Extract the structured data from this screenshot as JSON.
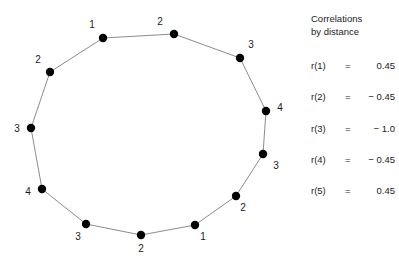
{
  "figure": {
    "background_color": "#ffffff",
    "node_color": "#000000",
    "edge_color": "#8c8c8c",
    "text_color": "#1b1b1b"
  },
  "legend": {
    "title": "Correlations\nby distance",
    "title_line_1": "Correlations",
    "title_line_2": "by distance",
    "rows": [
      {
        "key": "r(1)",
        "eq": "=",
        "value": "0.45"
      },
      {
        "key": "r(2)",
        "eq": "=",
        "value": "− 0.45"
      },
      {
        "key": "r(3)",
        "eq": "=",
        "value": "− 1.0"
      },
      {
        "key": "r(4)",
        "eq": "=",
        "value": "− 0.45"
      },
      {
        "key": "r(5)",
        "eq": "=",
        "value": "0.45"
      }
    ]
  },
  "chart_data": {
    "type": "scatter",
    "title": "Correlations by distance",
    "xlabel": "",
    "ylabel": "",
    "node_count": 12,
    "nodes": [
      {
        "index": 0,
        "label": "2",
        "x": 174,
        "y": 34,
        "label_x": 160,
        "label_y": 22
      },
      {
        "index": 1,
        "label": "3",
        "x": 240,
        "y": 58,
        "label_x": 251,
        "label_y": 45
      },
      {
        "index": 2,
        "label": "4",
        "x": 266,
        "y": 111,
        "label_x": 280,
        "label_y": 108
      },
      {
        "index": 3,
        "label": "3",
        "x": 263,
        "y": 154,
        "label_x": 276,
        "label_y": 166
      },
      {
        "index": 4,
        "label": "2",
        "x": 236,
        "y": 196,
        "label_x": 243,
        "label_y": 208
      },
      {
        "index": 5,
        "label": "1",
        "x": 195,
        "y": 225,
        "label_x": 203,
        "label_y": 237
      },
      {
        "index": 6,
        "label": "2",
        "x": 141,
        "y": 235,
        "label_x": 141,
        "label_y": 249
      },
      {
        "index": 7,
        "label": "3",
        "x": 86,
        "y": 224,
        "label_x": 78,
        "label_y": 237
      },
      {
        "index": 8,
        "label": "4",
        "x": 42,
        "y": 189,
        "label_x": 28,
        "label_y": 192
      },
      {
        "index": 9,
        "label": "3",
        "x": 31,
        "y": 128,
        "label_x": 17,
        "label_y": 129
      },
      {
        "index": 10,
        "label": "2",
        "x": 50,
        "y": 72,
        "label_x": 38,
        "label_y": 60
      },
      {
        "index": 11,
        "label": "1",
        "x": 103,
        "y": 38,
        "label_x": 92,
        "label_y": 25
      }
    ],
    "edges": [
      [
        0,
        1
      ],
      [
        1,
        2
      ],
      [
        2,
        3
      ],
      [
        3,
        4
      ],
      [
        4,
        5
      ],
      [
        5,
        6
      ],
      [
        6,
        7
      ],
      [
        7,
        8
      ],
      [
        8,
        9
      ],
      [
        9,
        10
      ],
      [
        10,
        11
      ],
      [
        11,
        0
      ]
    ],
    "series": [
      {
        "name": "Correlation by distance",
        "x": [
          1,
          2,
          3,
          4,
          5
        ],
        "values": [
          0.45,
          -0.45,
          -1.0,
          -0.45,
          0.45
        ]
      }
    ]
  }
}
